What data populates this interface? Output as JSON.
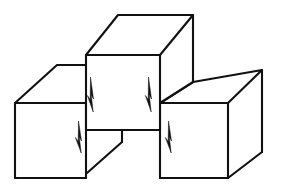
{
  "figure": {
    "background_color": "#ffffff",
    "line_color": "#111111",
    "face_color": "#ffffff",
    "line_width": 2.1,
    "canvas": {
      "width": 290,
      "height": 188
    }
  },
  "shapes": {
    "left_cube": {
      "name": "left-cube",
      "top_face": "15,103 57,65 124,65 86,103",
      "front_face": "15,103 86,103 86,178 15,178",
      "edges": [
        "M15,103 L57,65 L124,65",
        "M15,103 L86,103",
        "M86,103 L86,178",
        "M15,103 L15,178",
        "M15,178 L86,178"
      ]
    },
    "middle_cube": {
      "name": "middle-cube",
      "top_face": "86,55 118,15 193,15 160,55",
      "front_face": "86,55 160,55 160,130 86,130",
      "edges": [
        "M86,55 L118,15 L193,15 L160,55 Z",
        "M193,15 L193,82",
        "M160,55 L160,130",
        "M86,55 L86,172",
        "M86,130 L160,130"
      ]
    },
    "right_cube": {
      "name": "right-cube",
      "top_face": "160,103 193,82 262,70 228,103",
      "front_face": "160,103 228,103 228,178 160,178",
      "edges": [
        "M160,103 L193,82 L262,70 L228,103",
        "M160,103 L228,103",
        "M228,103 L228,178",
        "M262,70 L262,152",
        "M160,103 L160,178",
        "M160,178 L228,178",
        "M228,178 L262,152"
      ]
    },
    "impossible_notch": {
      "name": "impossible-notch",
      "edges": [
        "M122,130 L122,142",
        "M122,142 L88,172",
        "M86,172 L86,178"
      ]
    }
  },
  "arrows": [
    {
      "name": "arrow-middle-left",
      "points": "90,78 94,100 91,95 93,113 87,96 90,99",
      "orientation": "down"
    },
    {
      "name": "arrow-middle-right",
      "points": "148,78 152,100 149,95 151,113 145,96 148,99",
      "orientation": "down"
    },
    {
      "name": "arrow-left-cube",
      "points": "78,122 82,142 79,137 81,154 75,138 78,141",
      "orientation": "down"
    },
    {
      "name": "arrow-right-cube",
      "points": "168,122 172,142 169,137 171,154 165,138 168,141",
      "orientation": "down"
    }
  ]
}
